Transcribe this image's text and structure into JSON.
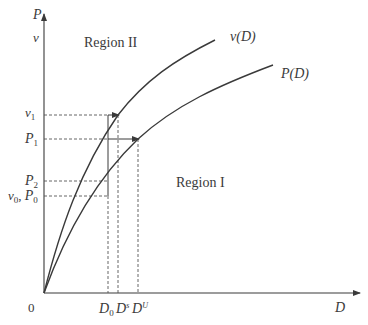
{
  "diagram": {
    "axes": {
      "y_label_top": "P",
      "y_label_second": "v",
      "x_label": "D",
      "origin_label": "0"
    },
    "curves": [
      {
        "name": "v-curve",
        "label": "v(D)"
      },
      {
        "name": "p-curve",
        "label": "P(D)"
      }
    ],
    "regions": {
      "region_2": "Region II",
      "region_1": "Region I"
    },
    "y_ticks": {
      "v1": {
        "base": "v",
        "sub": "1"
      },
      "p1": {
        "base": "P",
        "sub": "1"
      },
      "p2": {
        "base": "P",
        "sub": "2"
      },
      "v0p0": {
        "base1": "v",
        "sub1": "0",
        "sep": ", ",
        "base2": "P",
        "sub2": "0"
      }
    },
    "x_ticks": {
      "d0": {
        "base": "D",
        "sub": "0"
      },
      "ds": {
        "base": "D",
        "sup": "s"
      },
      "du": {
        "base": "D",
        "sup": "U"
      }
    },
    "colors": {
      "line": "#3a3a3a",
      "dashed": "#555555",
      "background": "#ffffff"
    }
  }
}
